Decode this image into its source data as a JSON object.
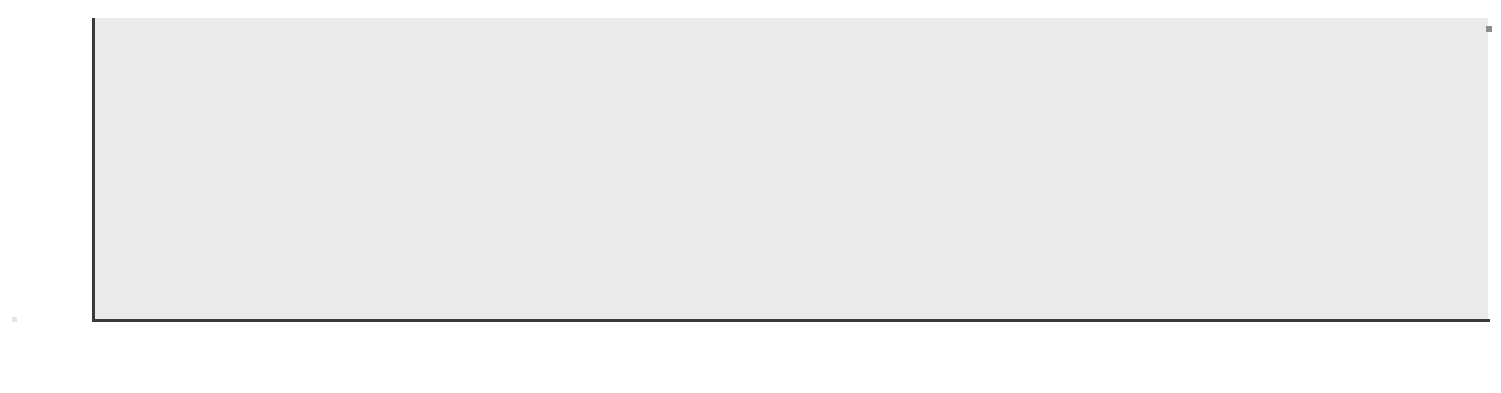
{
  "chart_data": {
    "type": "bar",
    "title": "",
    "xlabel": "",
    "ylabel": "Percent",
    "ylim": [
      0,
      26.5
    ],
    "yticks": [
      0,
      5,
      10,
      15,
      20,
      25
    ],
    "grid": true,
    "legend": "none",
    "orientation": "vertical",
    "value_labels": true,
    "categories": [
      "Switzer-\nland",
      "Norway",
      "Germany",
      "Sweden",
      "France",
      "Denmark",
      "Finland",
      "Italy",
      "Ireland",
      "Nether-\nlands",
      "Canada",
      "Spain",
      "United\nStates"
    ],
    "values": [
      3.0,
      3.7,
      4.4,
      4.7,
      5.5,
      6.0,
      6.1,
      9.2,
      11.8,
      12.6,
      14.9,
      17.5,
      21.3
    ],
    "value_text": [
      "3.0",
      "3.7",
      "4.4",
      "4.7",
      "5.5",
      "6.0",
      "6.1",
      "9.2",
      "11.8",
      "12.6",
      "14.9",
      "17.5",
      "21.3"
    ]
  },
  "axis": {
    "y_title": "Percent",
    "tick_labels": [
      "25",
      "20",
      "15",
      "10",
      "5",
      "0"
    ]
  },
  "category_labels": [
    {
      "line1": "Switzer-",
      "line2": "land"
    },
    {
      "line1": "Norway",
      "line2": ""
    },
    {
      "line1": "Germany",
      "line2": ""
    },
    {
      "line1": "Sweden",
      "line2": ""
    },
    {
      "line1": "France",
      "line2": ""
    },
    {
      "line1": "Denmark",
      "line2": ""
    },
    {
      "line1": "Finland",
      "line2": ""
    },
    {
      "line1": "Italy",
      "line2": ""
    },
    {
      "line1": "Ireland",
      "line2": ""
    },
    {
      "line1": "Nether-",
      "line2": "lands"
    },
    {
      "line1": "Canada",
      "line2": ""
    },
    {
      "line1": "Spain",
      "line2": ""
    },
    {
      "line1": "United",
      "line2": "States"
    }
  ],
  "style": {
    "plot_background": "#eaeaea",
    "gridline_color": "#fbfbfb",
    "axis_color": "#3a3a3a",
    "text_color": "#111111",
    "bar_shades": [
      {
        "top": "#575757",
        "bottom": "#a2a2a2"
      },
      {
        "top": "#a0a0a0",
        "bottom": "#c9c9c9"
      },
      {
        "top": "#5e5e5e",
        "bottom": "#a8a8a8"
      },
      {
        "top": "#4a4a4a",
        "bottom": "#8e8e8e"
      },
      {
        "top": "#a8a8a8",
        "bottom": "#c6c6c6"
      },
      {
        "top": "#b0b0b0",
        "bottom": "#cfcfcf"
      },
      {
        "top": "#585858",
        "bottom": "#a6a6a6"
      },
      {
        "top": "#565656",
        "bottom": "#a0a0a0"
      },
      {
        "top": "#6e6e6e",
        "bottom": "#b0b0b0"
      },
      {
        "top": "#8a8a8a",
        "bottom": "#b8b8b8"
      },
      {
        "top": "#b6b6b6",
        "bottom": "#d2d2d2"
      },
      {
        "top": "#6a6a6a",
        "bottom": "#adadad"
      },
      {
        "top": "#4c4c4c",
        "bottom": "#9a9a9a"
      }
    ]
  }
}
